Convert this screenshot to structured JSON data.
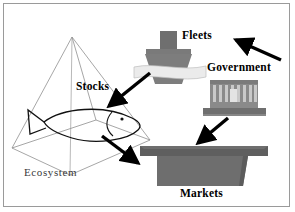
{
  "diagram": {
    "background_color": "#ffffff",
    "frame_color": "#9a9a9a",
    "labels": {
      "ecosystem": "Ecosystem",
      "stocks": "Stocks",
      "fleets": "Fleets",
      "government": "Government",
      "markets": "Markets"
    },
    "nodes": [
      {
        "id": "ecosystem",
        "label": "Ecosystem",
        "icon": "pyramid-wireframe-with-fish",
        "style": "wireframe",
        "line_color": "#808080",
        "fill": "none"
      },
      {
        "id": "stocks",
        "label": "Stocks",
        "icon": "fish-outline",
        "style": "outline",
        "line_color": "#000000",
        "fill": "none"
      },
      {
        "id": "fleets",
        "label": "Fleets",
        "icon": "fishing-boat",
        "style": "solid",
        "fill": "#7d7d7d",
        "accent_fill": "#e8e8e8"
      },
      {
        "id": "government",
        "label": "Government",
        "icon": "classical-building",
        "style": "solid",
        "fill": "#8a8a8a",
        "accent_fill": "#6f6f6f"
      },
      {
        "id": "markets",
        "label": "Markets",
        "icon": "market-stall-table",
        "style": "solid",
        "fill": "#6e6e6e",
        "accent_fill": "#5c5c5c"
      }
    ],
    "arrows": [
      {
        "id": "fleets-to-stocks",
        "from": "fleets",
        "to": "stocks",
        "direction": "down-left",
        "color": "#000000"
      },
      {
        "id": "government-to-fleets",
        "from": "government",
        "to": "fleets",
        "direction": "up-left",
        "color": "#000000"
      },
      {
        "id": "government-to-markets",
        "from": "government",
        "to": "markets",
        "direction": "down-left",
        "color": "#000000"
      },
      {
        "id": "stocks-to-markets",
        "from": "stocks",
        "to": "markets",
        "direction": "down-right",
        "color": "#000000"
      }
    ]
  }
}
